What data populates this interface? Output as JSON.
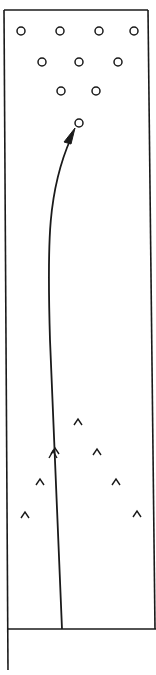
{
  "diagram": {
    "colors": {
      "ink": "#1a1a1a",
      "background": "#ffffff"
    },
    "lane": {
      "top_left": [
        4,
        10
      ],
      "top_right": [
        148,
        10
      ],
      "bottom_left": [
        7,
        629
      ],
      "bottom_right": [
        155,
        629
      ],
      "approach_line_end": [
        8,
        670
      ]
    },
    "foul_line_y": 629,
    "pins": [
      {
        "x": 21,
        "y": 31
      },
      {
        "x": 60,
        "y": 31
      },
      {
        "x": 99,
        "y": 31
      },
      {
        "x": 134,
        "y": 31
      },
      {
        "x": 42,
        "y": 62
      },
      {
        "x": 79,
        "y": 62
      },
      {
        "x": 118,
        "y": 62
      },
      {
        "x": 61,
        "y": 91
      },
      {
        "x": 96,
        "y": 91
      },
      {
        "x": 79,
        "y": 123
      }
    ],
    "pin_radius": 4,
    "target_arrows": [
      {
        "x": 78,
        "y": 421
      },
      {
        "x": 55,
        "y": 450
      },
      {
        "x": 97,
        "y": 451
      },
      {
        "x": 40,
        "y": 481
      },
      {
        "x": 116,
        "y": 481
      },
      {
        "x": 25,
        "y": 514
      },
      {
        "x": 137,
        "y": 513
      }
    ],
    "ball_path": {
      "start": [
        62,
        629
      ],
      "end": [
        75,
        128
      ],
      "description": "ball path curving toward head pin"
    }
  }
}
